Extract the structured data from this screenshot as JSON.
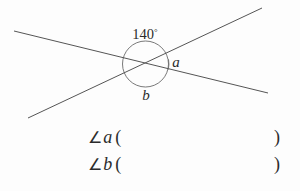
{
  "figure": {
    "angle_label_value": "140",
    "angle_label_degree": "°",
    "label_a": "a",
    "label_b": "b",
    "stroke_color": "#555555",
    "text_color": "#2b2b2b",
    "background_color": "#fdfdfd",
    "lines": [
      {
        "name": "line-1",
        "x1": 14,
        "y1": 31,
        "x2": 268,
        "y2": 93
      },
      {
        "name": "line-2",
        "x1": 28,
        "y1": 118,
        "x2": 262,
        "y2": 8
      }
    ],
    "intersection": {
      "x": 145,
      "y": 62
    },
    "circle": {
      "cx": 145.5,
      "cy": 64,
      "r": 23
    },
    "arc_a": {
      "description": "small arc marking angle a"
    }
  },
  "answers": {
    "rows": [
      {
        "angle_symbol": "∠",
        "variable": "a",
        "open_paren": "(",
        "close_paren": ")",
        "value": ""
      },
      {
        "angle_symbol": "∠",
        "variable": "b",
        "open_paren": "(",
        "close_paren": ")",
        "value": ""
      }
    ]
  }
}
